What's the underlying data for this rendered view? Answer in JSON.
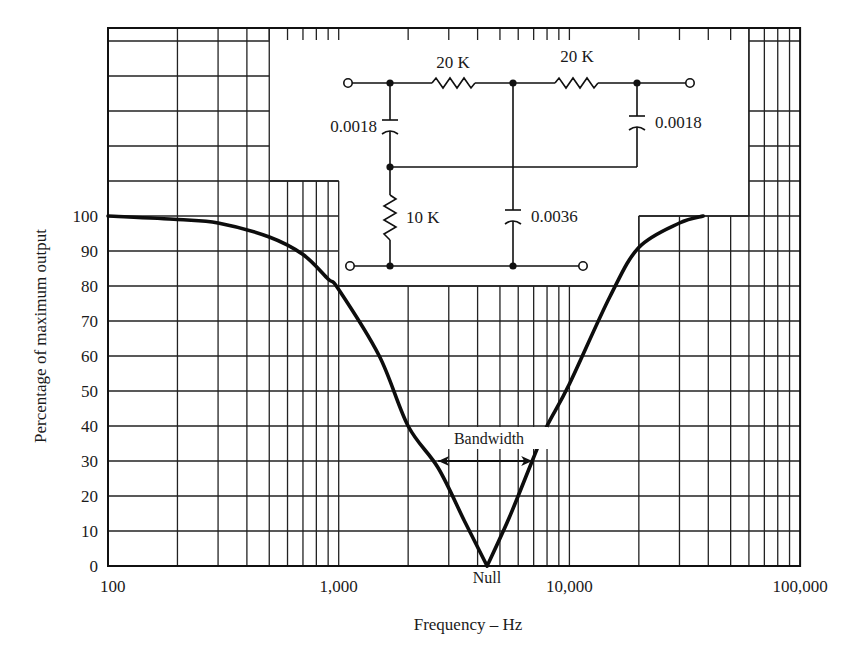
{
  "chart_data": {
    "type": "line",
    "title": "",
    "xlabel": "Frequency – Hz",
    "ylabel": "Percentage of maximum output",
    "xscale": "log",
    "xlim": [
      100,
      100000
    ],
    "ylim": [
      0,
      100
    ],
    "grid": true,
    "legend": null,
    "x_tick_labels": [
      {
        "value": 100,
        "label": "100"
      },
      {
        "value": 1000,
        "label": "1,000"
      },
      {
        "value": 10000,
        "label": "10,000"
      },
      {
        "value": 100000,
        "label": "100,000"
      }
    ],
    "y_tick_labels": [
      "0",
      "10",
      "20",
      "30",
      "40",
      "50",
      "60",
      "70",
      "80",
      "90",
      "100"
    ],
    "series": [
      {
        "name": "Twin-T notch filter response",
        "x": [
          100,
          200,
          300,
          500,
          700,
          900,
          1000,
          1500,
          2000,
          2700,
          3500,
          4400,
          5500,
          6900,
          8000,
          10000,
          15000,
          20000,
          30000,
          38000
        ],
        "y": [
          100,
          99,
          98,
          94,
          89,
          82,
          79,
          60,
          40,
          28,
          13,
          0,
          14,
          30,
          40,
          52,
          77,
          91,
          98,
          100
        ]
      }
    ],
    "annotations": [
      {
        "text": "Null",
        "x": 4400,
        "y": 0,
        "position": "below-axis"
      },
      {
        "text": "Bandwidth",
        "type": "double-arrow",
        "x_start": 2700,
        "x_end": 6900,
        "y": 30
      }
    ],
    "inset_circuit": {
      "topology": "twin-T notch filter",
      "series_resistors": [
        "20 K",
        "20 K"
      ],
      "shunt_resistor": "10 K",
      "series_capacitors": [
        "0.0018",
        "0.0018"
      ],
      "shunt_capacitor": "0.0036"
    }
  },
  "labels": {
    "ylabel": "Percentage of maximum output",
    "xlabel": "Frequency – Hz",
    "null": "Null",
    "bandwidth": "Bandwidth",
    "r1": "20 K",
    "r2": "20 K",
    "r3": "10 K",
    "c1": "0.0018",
    "c2": "0.0018",
    "c3": "0.0036"
  },
  "style": {
    "ink": "#111111",
    "paper": "#ffffff"
  }
}
